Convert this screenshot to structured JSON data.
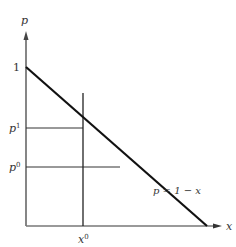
{
  "diagram": {
    "axes": {
      "y_label": "p",
      "x_label": "x"
    },
    "y_ticks": {
      "one": "1",
      "p1_base": "p",
      "p1_sup": "1",
      "p0_base": "p",
      "p0_sup": "0"
    },
    "x_ticks": {
      "x0_base": "x",
      "x0_sup": "0"
    },
    "line_label": "p = 1 − x",
    "colors": {
      "axis": "#444444",
      "demand_line": "#111111",
      "guide_lines": "#333333"
    }
  }
}
